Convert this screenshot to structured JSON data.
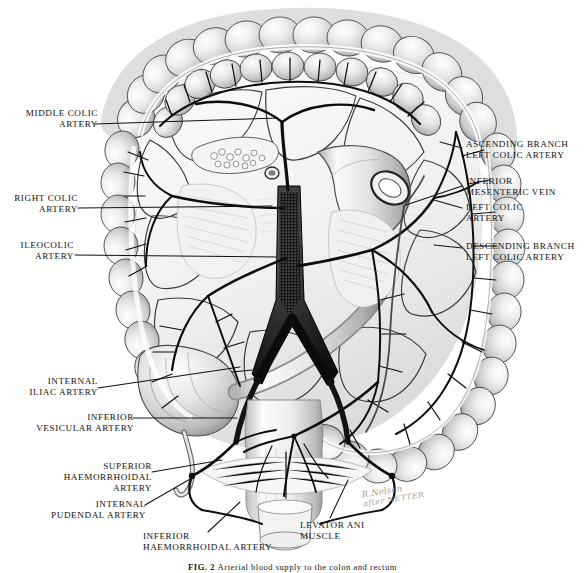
{
  "plate": {
    "title": "Arterial supply of the colon, rectum and anal canal",
    "background_color": "#ffffff",
    "ink_color": "#121212",
    "width": 585,
    "height": 573
  },
  "caption": {
    "figure_number": "FIG. 2",
    "text": "Arterial blood supply to the colon and rectum"
  },
  "signature": {
    "line1": "R.Nelson",
    "line2": "after NETTER"
  },
  "labels": {
    "left": [
      {
        "id": "middle-colic-artery",
        "lines": [
          "MIDDLE COLIC",
          "ARTERY"
        ]
      },
      {
        "id": "right-colic-artery",
        "lines": [
          "RIGHT COLIC",
          "ARTERY"
        ]
      },
      {
        "id": "ileocolic-artery",
        "lines": [
          "ILEOCOLIC",
          "ARTERY"
        ]
      },
      {
        "id": "internal-iliac-artery",
        "lines": [
          "INTERNAL",
          "ILIAC ARTERY"
        ]
      },
      {
        "id": "inferior-vesicular-artery",
        "lines": [
          "INFERIOR",
          "VESICULAR ARTERY"
        ]
      },
      {
        "id": "superior-haemorrhoidal-artery",
        "lines": [
          "SUPERIOR",
          "HAEMORRHOIDAL",
          "ARTERY"
        ]
      },
      {
        "id": "internal-pudendal-artery",
        "lines": [
          "INTERNAL",
          "PUDENDAL ARTERY"
        ]
      }
    ],
    "right": [
      {
        "id": "ascending-branch-left-colic-artery",
        "lines": [
          "ASCENDING BRANCH",
          "LEFT COLIC ARTERY"
        ]
      },
      {
        "id": "inferior-mesenteric-vein",
        "lines": [
          "INFERIOR",
          "MESENTERIC VEIN"
        ]
      },
      {
        "id": "left-colic-artery",
        "lines": [
          "LEFT COLIC",
          "ARTERY"
        ]
      },
      {
        "id": "descending-branch-left-colic-artery",
        "lines": [
          "DESCENDING BRANCH",
          "LEFT COLIC ARTERY"
        ]
      },
      {
        "id": "levator-ani-muscle",
        "lines": [
          "LEVATOR ANI",
          "MUSCLE"
        ]
      }
    ],
    "bottom": [
      {
        "id": "inferior-haemorrhoidal-artery",
        "lines": [
          "INFERIOR",
          "HAEMORRHOIDAL ARTERY"
        ]
      }
    ]
  },
  "label_text": {
    "middle_colic_artery": "MIDDLE COLIC\nARTERY",
    "right_colic_artery": "RIGHT COLIC\nARTERY",
    "ileocolic_artery": "ILEOCOLIC\nARTERY",
    "internal_iliac_artery": "INTERNAL\nILIAC ARTERY",
    "inferior_vesicular_artery": "INFERIOR\nVESICULAR ARTERY",
    "superior_haemorrhoidal_artery": "SUPERIOR\nHAEMORRHOIDAL\nARTERY",
    "internal_pudendal_artery": "INTERNAL\nPUDENDAL ARTERY",
    "inferior_haemorrhoidal_artery": "INFERIOR\nHAEMORRHOIDAL ARTERY",
    "ascending_branch_left_colic_artery": "ASCENDING BRANCH\nLEFT COLIC ARTERY",
    "inferior_mesenteric_vein": "INFERIOR\nMESENTERIC VEIN",
    "left_colic_artery": "LEFT COLIC\nARTERY",
    "descending_branch_left_colic_artery": "DESCENDING BRANCH\nLEFT COLIC ARTERY",
    "levator_ani_muscle": "LEVATOR ANI\nMUSCLE"
  }
}
